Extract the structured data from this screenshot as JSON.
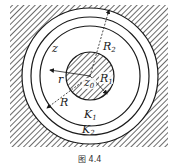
{
  "figure": {
    "caption": "图 4.4",
    "colors": {
      "ink": "#1a1a1a",
      "background": "#ffffff"
    },
    "regions": {
      "outer_hatched": "exterior region (hatched)",
      "annulus": "clear annulus",
      "inner_disc": "hatched disc centered at z0"
    },
    "labels": {
      "z": "z",
      "z0": "z",
      "z0_sub": "0",
      "r": "r",
      "R": "R",
      "R1": "R",
      "R1_sub": "1",
      "R2": "R",
      "R2_sub": "2",
      "K1": "K",
      "K1_sub": "1",
      "K2": "K",
      "K2_sub": "2"
    },
    "circles": [
      {
        "name": "inner-disc",
        "radius_label": "R1"
      },
      {
        "name": "K1",
        "radius_label": "r"
      },
      {
        "name": "K2",
        "radius_label": "R"
      },
      {
        "name": "outer-boundary",
        "radius_label": "R2"
      }
    ]
  }
}
